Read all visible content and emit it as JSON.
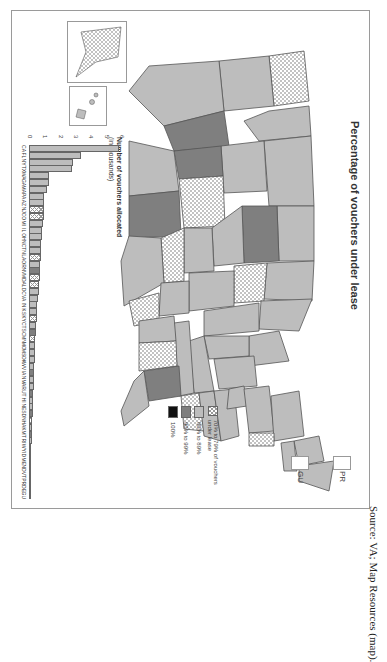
{
  "figure": {
    "map_title": "Percentage of vouchers under lease",
    "territories": [
      {
        "code": "PR"
      },
      {
        "code": "GU"
      }
    ],
    "legend": {
      "title_suffix": "of vouchers under lease",
      "items": [
        {
          "label": "70% to 79% of vouchers under lease",
          "class": "c70",
          "color": "#ffffff",
          "pattern": "crosshatch"
        },
        {
          "label": "80% to 89%",
          "class": "c80",
          "color": "#bdbdbd"
        },
        {
          "label": "90% to 99%",
          "class": "c90",
          "color": "#7f7f7f"
        },
        {
          "label": "100%",
          "class": "c100",
          "color": "#111111"
        }
      ]
    },
    "bar_axis_title_bold": "Number of vouchers allocated",
    "bar_axis_title_normal": "(in thousands)"
  },
  "source": "Source: VA; Map Resources (map).",
  "chart_data": [
    {
      "type": "bar",
      "title": "Number of vouchers allocated (in thousands)",
      "xlabel": "",
      "ylabel": "Number of vouchers allocated (in thousands)",
      "ylim": [
        0,
        6
      ],
      "yticks": [
        0,
        1,
        2,
        3,
        4,
        5,
        6
      ],
      "grid": false,
      "orientation": "vertical (figure rotated 90° on page)",
      "categories": [
        "CA",
        "FL",
        "NY",
        "TX",
        "WA",
        "GA",
        "MA",
        "PA",
        "AZ",
        "NJ",
        "CO",
        "MI",
        "IL",
        "OH",
        "NC",
        "TN",
        "LA",
        "OR",
        "NV",
        "MD",
        "AL",
        "DC",
        "VA",
        "IN",
        "KS",
        "KY",
        "CT",
        "SC",
        "MN",
        "MO",
        "MS",
        "OK",
        "WV",
        "IA",
        "NM",
        "AR",
        "UT",
        "HI",
        "NE",
        "SD",
        "NH",
        "AK",
        "MT",
        "RI",
        "WY",
        "ID",
        "ME",
        "ND",
        "VT",
        "PR",
        "DE",
        "GU"
      ],
      "values": [
        5.9,
        3.4,
        2.9,
        2.8,
        1.3,
        1.3,
        1.2,
        1.0,
        1.0,
        0.95,
        0.95,
        0.9,
        0.85,
        0.85,
        0.8,
        0.8,
        0.78,
        0.75,
        0.7,
        0.7,
        0.68,
        0.65,
        0.6,
        0.55,
        0.5,
        0.5,
        0.48,
        0.45,
        0.42,
        0.4,
        0.38,
        0.36,
        0.35,
        0.34,
        0.32,
        0.3,
        0.28,
        0.27,
        0.26,
        0.24,
        0.22,
        0.2,
        0.2,
        0.18,
        0.16,
        0.15,
        0.14,
        0.12,
        0.1,
        0.08,
        0.05,
        0.02
      ],
      "lease_category": [
        "c80",
        "c80",
        "c80",
        "c80",
        "c80",
        "c80",
        "c80",
        "c80",
        "c80",
        "c70",
        "c70",
        "c80",
        "c80",
        "c80",
        "c80",
        "c80",
        "c70",
        "c80",
        "c90",
        "c70",
        "c70",
        "c80",
        "c80",
        "c80",
        "c80",
        "c70",
        "c80",
        "c90",
        "c70",
        "c80",
        "c80",
        "c80",
        "c80",
        "c90",
        "c80",
        "c80",
        "c90",
        "c80",
        "c80",
        "c90",
        "c70",
        "c80",
        "c90",
        "c80",
        "c70",
        "c80",
        "c80",
        "c80",
        "c80",
        "c80",
        "c80",
        "c100"
      ]
    },
    {
      "type": "heatmap",
      "title": "Percentage of vouchers under lease",
      "legend": [
        "70% to 79%",
        "80% to 89%",
        "90% to 99%",
        "100%"
      ],
      "note": "Choropleth map of US states shaded by percentage of vouchers under lease"
    }
  ]
}
